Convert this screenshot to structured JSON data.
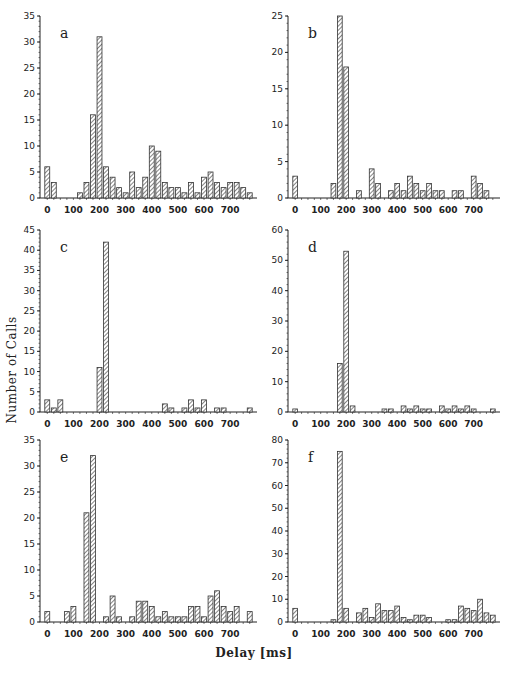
{
  "figure": {
    "y_axis_label": "Number of Calls",
    "x_axis_label": "Delay [ms]",
    "caption_fragment": "Figure 7. The distribution of the delay..."
  },
  "style": {
    "bar_stroke": "#333333",
    "hatch_color": "#333333",
    "axis_color": "#222222",
    "background": "#ffffff"
  },
  "chart_data": [
    {
      "type": "bar",
      "panel": "a",
      "title": "a",
      "xlabel": "Delay [ms]",
      "ylabel": "Number of Calls",
      "bin_width_ms": 25,
      "x": [
        0,
        25,
        50,
        75,
        100,
        125,
        150,
        175,
        200,
        225,
        250,
        275,
        300,
        325,
        350,
        375,
        400,
        425,
        450,
        475,
        500,
        525,
        550,
        575,
        600,
        625,
        650,
        675,
        700,
        725,
        750,
        775
      ],
      "values": [
        6,
        3,
        0,
        0,
        0,
        1,
        3,
        16,
        31,
        6,
        4,
        2,
        1,
        5,
        2,
        4,
        10,
        9,
        3,
        2,
        2,
        1,
        3,
        1,
        4,
        5,
        3,
        2,
        3,
        3,
        2,
        1
      ],
      "ylim": [
        0,
        35
      ],
      "yticks": [
        0,
        5,
        10,
        15,
        20,
        25,
        30,
        35
      ],
      "xticks": [
        0,
        100,
        200,
        300,
        400,
        500,
        600,
        700
      ],
      "grid": false
    },
    {
      "type": "bar",
      "panel": "b",
      "title": "b",
      "xlabel": "Delay [ms]",
      "ylabel": "Number of Calls",
      "bin_width_ms": 25,
      "x": [
        0,
        25,
        50,
        75,
        100,
        125,
        150,
        175,
        200,
        225,
        250,
        275,
        300,
        325,
        350,
        375,
        400,
        425,
        450,
        475,
        500,
        525,
        550,
        575,
        600,
        625,
        650,
        675,
        700,
        725,
        750,
        775
      ],
      "values": [
        3,
        0,
        0,
        0,
        0,
        0,
        2,
        25,
        18,
        0,
        1,
        0,
        4,
        2,
        0,
        1,
        2,
        1,
        3,
        2,
        1,
        2,
        1,
        1,
        0,
        1,
        1,
        0,
        3,
        2,
        1,
        0
      ],
      "ylim": [
        0,
        25
      ],
      "yticks": [
        0,
        5,
        10,
        15,
        20,
        25
      ],
      "xticks": [
        0,
        100,
        200,
        300,
        400,
        500,
        600,
        700
      ],
      "grid": false
    },
    {
      "type": "bar",
      "panel": "c",
      "title": "c",
      "xlabel": "Delay [ms]",
      "ylabel": "Number of Calls",
      "bin_width_ms": 25,
      "x": [
        0,
        25,
        50,
        75,
        100,
        125,
        150,
        175,
        200,
        225,
        250,
        275,
        300,
        325,
        350,
        375,
        400,
        425,
        450,
        475,
        500,
        525,
        550,
        575,
        600,
        625,
        650,
        675,
        700,
        725,
        750,
        775
      ],
      "values": [
        3,
        1,
        3,
        0,
        0,
        0,
        0,
        0,
        11,
        42,
        0,
        0,
        0,
        0,
        0,
        0,
        0,
        0,
        2,
        1,
        0,
        1,
        3,
        1,
        3,
        0,
        1,
        1,
        0,
        0,
        0,
        1
      ],
      "ylim": [
        0,
        45
      ],
      "yticks": [
        0,
        5,
        10,
        15,
        20,
        25,
        30,
        35,
        40,
        45
      ],
      "xticks": [
        0,
        100,
        200,
        300,
        400,
        500,
        600,
        700
      ],
      "grid": false
    },
    {
      "type": "bar",
      "panel": "d",
      "title": "d",
      "xlabel": "Delay [ms]",
      "ylabel": "Number of Calls",
      "bin_width_ms": 25,
      "x": [
        0,
        25,
        50,
        75,
        100,
        125,
        150,
        175,
        200,
        225,
        250,
        275,
        300,
        325,
        350,
        375,
        400,
        425,
        450,
        475,
        500,
        525,
        550,
        575,
        600,
        625,
        650,
        675,
        700,
        725,
        750,
        775
      ],
      "values": [
        1,
        0,
        0,
        0,
        0,
        0,
        0,
        16,
        53,
        2,
        0,
        0,
        0,
        0,
        1,
        1,
        0,
        2,
        1,
        2,
        1,
        1,
        0,
        2,
        1,
        2,
        1,
        2,
        1,
        0,
        0,
        1
      ],
      "ylim": [
        0,
        60
      ],
      "yticks": [
        0,
        10,
        20,
        30,
        40,
        50,
        60
      ],
      "xticks": [
        0,
        100,
        200,
        300,
        400,
        500,
        600,
        700
      ],
      "grid": false
    },
    {
      "type": "bar",
      "panel": "e",
      "title": "e",
      "xlabel": "Delay [ms]",
      "ylabel": "Number of Calls",
      "bin_width_ms": 25,
      "x": [
        0,
        25,
        50,
        75,
        100,
        125,
        150,
        175,
        200,
        225,
        250,
        275,
        300,
        325,
        350,
        375,
        400,
        425,
        450,
        475,
        500,
        525,
        550,
        575,
        600,
        625,
        650,
        675,
        700,
        725,
        750,
        775
      ],
      "values": [
        2,
        0,
        0,
        2,
        3,
        0,
        21,
        32,
        0,
        1,
        5,
        1,
        0,
        1,
        4,
        4,
        3,
        1,
        2,
        1,
        1,
        1,
        3,
        3,
        1,
        5,
        6,
        3,
        2,
        3,
        0,
        2
      ],
      "ylim": [
        0,
        35
      ],
      "yticks": [
        0,
        5,
        10,
        15,
        20,
        25,
        30,
        35
      ],
      "xticks": [
        0,
        100,
        200,
        300,
        400,
        500,
        600,
        700
      ],
      "grid": false
    },
    {
      "type": "bar",
      "panel": "f",
      "title": "f",
      "xlabel": "Delay [ms]",
      "ylabel": "Number of Calls",
      "bin_width_ms": 25,
      "x": [
        0,
        25,
        50,
        75,
        100,
        125,
        150,
        175,
        200,
        225,
        250,
        275,
        300,
        325,
        350,
        375,
        400,
        425,
        450,
        475,
        500,
        525,
        550,
        575,
        600,
        625,
        650,
        675,
        700,
        725,
        750,
        775
      ],
      "values": [
        6,
        0,
        0,
        0,
        0,
        0,
        1,
        75,
        6,
        0,
        4,
        6,
        2,
        8,
        5,
        5,
        7,
        2,
        1,
        3,
        3,
        2,
        0,
        0,
        1,
        1,
        7,
        6,
        5,
        10,
        4,
        3
      ],
      "ylim": [
        0,
        80
      ],
      "yticks": [
        0,
        10,
        20,
        30,
        40,
        50,
        60,
        70,
        80
      ],
      "xticks": [
        0,
        100,
        200,
        300,
        400,
        500,
        600,
        700
      ],
      "grid": false
    }
  ]
}
